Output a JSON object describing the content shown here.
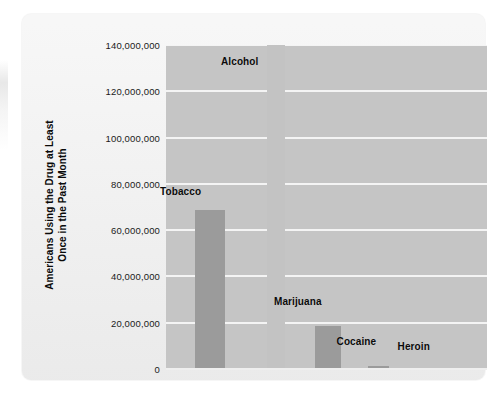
{
  "chart_data": {
    "type": "bar",
    "title": "",
    "xlabel": "",
    "ylabel": "Americans Using the Drug at Least Once in the Past Month",
    "ylabel_line1": "Americans Using the Drug at Least",
    "ylabel_line2": "Once in the Past Month",
    "categories": [
      "Tobacco",
      "Alcohol",
      "Marijuana",
      "Cocaine",
      "Heroin"
    ],
    "values": [
      68700000,
      140000000,
      18500000,
      1500000,
      400000
    ],
    "ylim": [
      0,
      140000000
    ],
    "ytick_values": [
      0,
      20000000,
      40000000,
      60000000,
      80000000,
      100000000,
      120000000,
      140000000
    ],
    "ytick_labels": [
      "0",
      "20,000,000",
      "40,000,000",
      "60,000,000",
      "80,000,000",
      "100,000,000",
      "120,000,000",
      "140,000,000"
    ],
    "grid": true,
    "legend": "none",
    "bar_color": "#9b9b9b",
    "alcohol_bar_color": "#c3c3c3",
    "plot_background": "#c5c5c5",
    "gridline_color": "#f4f4f4",
    "panel_background": "#eeeeee",
    "bars": [
      {
        "label": "Tobacco",
        "value": 68700000,
        "left_pct": 9.0,
        "width_pct": 9.3,
        "pale": false,
        "label_left_pct": 5.0,
        "label_top_px": 186
      },
      {
        "label": "Alcohol",
        "value": 140000000,
        "left_pct": 31.5,
        "width_pct": 5.6,
        "pale": true,
        "label_left_pct": 24.0,
        "label_top_px": 56
      },
      {
        "label": "Marijuana",
        "value": 18500000,
        "left_pct": 46.5,
        "width_pct": 8.1,
        "pale": false,
        "label_left_pct": 40.5,
        "label_top_px": 296
      },
      {
        "label": "Cocaine",
        "value": 1500000,
        "left_pct": 63.0,
        "width_pct": 6.5,
        "pale": false,
        "label_left_pct": 60.0,
        "label_top_px": 336
      },
      {
        "label": "Heroin",
        "value": 400000,
        "left_pct": 82.0,
        "width_pct": 6.5,
        "pale": false,
        "label_left_pct": 79.0,
        "label_top_px": 341
      }
    ]
  }
}
